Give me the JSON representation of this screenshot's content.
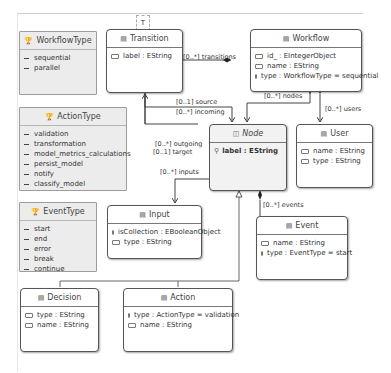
{
  "diagram": {
    "type": "UML class diagram (Ecore)",
    "top_tab_label": "T",
    "enums": [
      {
        "name": "WorkflowType",
        "literals": [
          "sequential",
          "parallel"
        ]
      },
      {
        "name": "ActionType",
        "literals": [
          "validation",
          "transformation",
          "model_metrics_calculations",
          "persist_model",
          "notify",
          "classify_model"
        ]
      },
      {
        "name": "EventType",
        "literals": [
          "start",
          "end",
          "error",
          "break",
          "continue"
        ]
      }
    ],
    "classes": {
      "transition": {
        "name": "Transition",
        "attrs": [
          "label : EString"
        ]
      },
      "workflow": {
        "name": "Workflow",
        "attrs": [
          "id_ : EIntegerObject",
          "name : EString",
          "type : WorkflowType = sequential"
        ]
      },
      "node": {
        "name": "Node",
        "abstract": true,
        "attrs": [
          "label : EString"
        ]
      },
      "user": {
        "name": "User",
        "attrs": [
          "name : EString",
          "type : EString"
        ]
      },
      "input": {
        "name": "Input",
        "attrs": [
          "isCollection : EBooleanObject",
          "type : EString"
        ]
      },
      "event": {
        "name": "Event",
        "attrs": [
          "name : EString",
          "type : EventType = start"
        ]
      },
      "decision": {
        "name": "Decision",
        "attrs": [
          "type : EString",
          "name : EString"
        ]
      },
      "action": {
        "name": "Action",
        "attrs": [
          "type : ActionType = validation",
          "name : EString"
        ]
      }
    },
    "references": {
      "transitions": "[0..*] transitions",
      "source": "[0..1] source",
      "incoming": "[0..*] incoming",
      "nodes": "[0..*] nodes",
      "users": "[0..*] users",
      "outgoing": "[0..*] outgoing",
      "target": "[0..1] target",
      "inputs": "[0..*] inputs",
      "events": "[0..*] events"
    }
  }
}
